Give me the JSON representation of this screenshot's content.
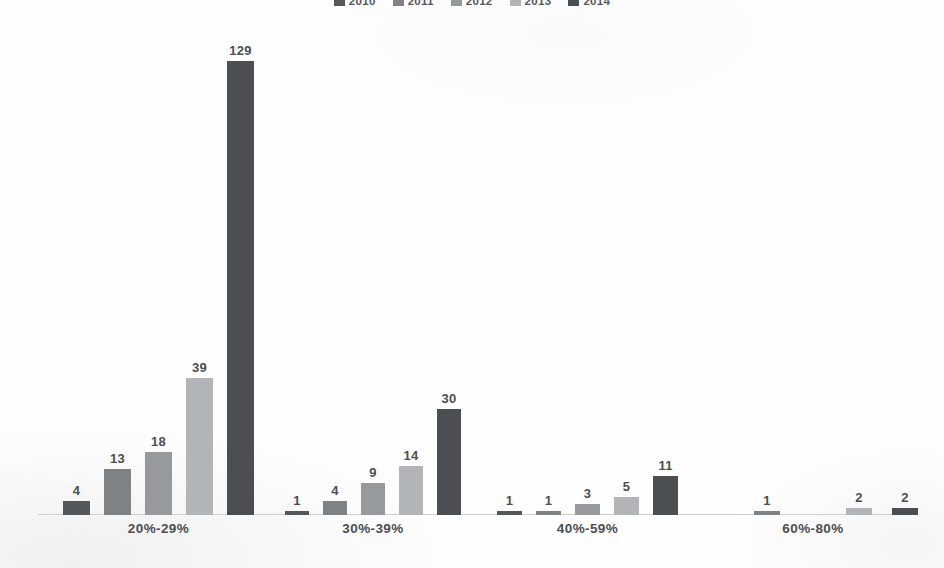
{
  "chart_data": {
    "type": "bar",
    "title": "",
    "xlabel": "",
    "ylabel": "",
    "grid": false,
    "legend_position": "top",
    "ylim": [
      0,
      135
    ],
    "categories": [
      "20%-29%",
      "30%-39%",
      "40%-59%",
      "60%-80%"
    ],
    "series": [
      {
        "name": "2010",
        "color": "#55585b",
        "values": [
          4,
          1,
          1,
          0
        ]
      },
      {
        "name": "2011",
        "color": "#7f8285",
        "values": [
          13,
          4,
          1,
          1
        ]
      },
      {
        "name": "2012",
        "color": "#969a9d",
        "values": [
          18,
          9,
          3,
          0
        ]
      },
      {
        "name": "2013",
        "color": "#b2b5b7",
        "values": [
          39,
          14,
          5,
          2
        ]
      },
      {
        "name": "2014",
        "color": "#4c4f52",
        "values": [
          129,
          30,
          11,
          2
        ]
      }
    ],
    "data_labels": [
      [
        "4",
        "13",
        "18",
        "39",
        "129"
      ],
      [
        "1",
        "4",
        "9",
        "14",
        "30"
      ],
      [
        "1",
        "1",
        "3",
        "5",
        "11"
      ],
      [
        "",
        "1",
        "",
        "2",
        "2"
      ]
    ]
  },
  "legend": {
    "items": [
      {
        "label": "2010",
        "color": "#55585b"
      },
      {
        "label": "2011",
        "color": "#7f8285"
      },
      {
        "label": "2012",
        "color": "#969a9d"
      },
      {
        "label": "2013",
        "color": "#b2b5b7"
      },
      {
        "label": "2014",
        "color": "#4c4f52"
      }
    ]
  },
  "axis": {
    "baseline_color": "#cfcfcf",
    "category_labels": [
      "20%-29%",
      "30%-39%",
      "40%-59%",
      "60%-80%"
    ]
  }
}
